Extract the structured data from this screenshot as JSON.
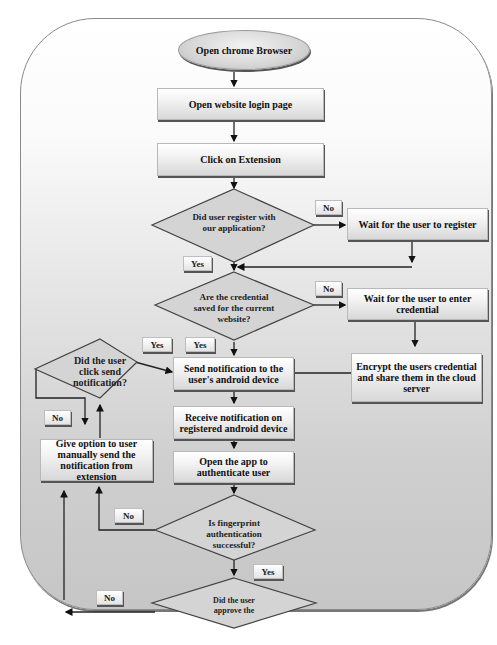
{
  "flowchart": {
    "start": "Open chrome Browser",
    "steps": {
      "open_login": "Open website login page",
      "click_extension": "Click on Extension",
      "wait_register": "Wait for the user to register",
      "wait_credential": "Wait for the user to enter credential",
      "encrypt_share": "Encrypt the users credential and share them in the cloud server",
      "send_notification": "Send notification to the user's android device",
      "receive_notification": "Receive notification on registered android device",
      "open_app": "Open the app to authenticate user",
      "give_option": "Give option to user manually send the notification from extension"
    },
    "decisions": {
      "registered": "Did user register with our application?",
      "credential_saved": "Are the credential saved for the current website?",
      "click_send": "Did the user click send notification?",
      "fingerprint": "Is fingerprint authentication successful?",
      "approve": "Did the user approve the"
    },
    "edge_labels": {
      "registered_no": "No",
      "registered_yes": "Yes",
      "saved_no": "No",
      "saved_yes": "Yes",
      "click_send_yes": "Yes",
      "click_send_no": "No",
      "fingerprint_no": "No",
      "fingerprint_yes": "Yes",
      "approve_no": "No"
    }
  }
}
